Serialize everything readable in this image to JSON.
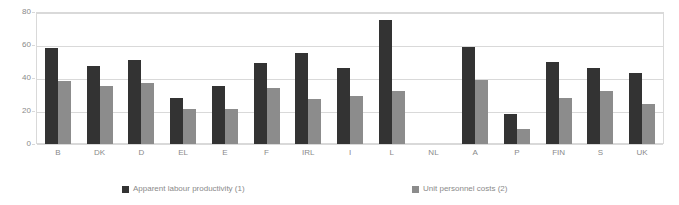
{
  "chart_data": {
    "type": "bar",
    "title": "",
    "xlabel": "",
    "ylabel": "",
    "ylim": [
      0,
      80
    ],
    "yticks": [
      0,
      20,
      40,
      60,
      80
    ],
    "grid": true,
    "legend_position": "bottom",
    "categories": [
      "B",
      "DK",
      "D",
      "EL",
      "E",
      "F",
      "IRL",
      "I",
      "L",
      "NL",
      "A",
      "P",
      "FIN",
      "S",
      "UK"
    ],
    "series": [
      {
        "name": "Apparent labour productivity (1)",
        "color": "#333333",
        "values": [
          58,
          47,
          51,
          28,
          35,
          49,
          55,
          46,
          75,
          null,
          59,
          18,
          50,
          46,
          43
        ]
      },
      {
        "name": "Unit personnel costs (2)",
        "color": "#8c8c8c",
        "values": [
          38,
          35,
          37,
          21,
          21,
          34,
          27,
          29,
          32,
          null,
          39,
          9,
          28,
          32,
          24
        ]
      }
    ]
  },
  "axis": {
    "y_tick_labels": [
      "0",
      "20",
      "40",
      "60",
      "80"
    ]
  },
  "legend": {
    "items": [
      {
        "label": "Apparent labour productivity (1)",
        "color": "#333333"
      },
      {
        "label": "Unit personnel costs (2)",
        "color": "#8c8c8c"
      }
    ]
  },
  "colors": {
    "series_dark": "#333333",
    "series_light": "#8c8c8c",
    "gridline": "#d9d9d9",
    "text": "#8a8a8a",
    "background": "#ffffff"
  }
}
